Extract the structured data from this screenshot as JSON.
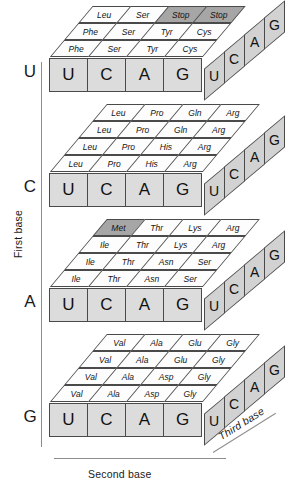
{
  "diagram": {
    "axes": {
      "first_base": "First base",
      "second_base": "Second base",
      "third_base": "Third base"
    },
    "second_base_letters": [
      "U",
      "C",
      "A",
      "G"
    ],
    "third_base_letters": [
      "U",
      "C",
      "A",
      "G"
    ],
    "colors": {
      "background": "#ffffff",
      "cell_fill": "#fdfdfd",
      "highlight_fill": "#a6a6a6",
      "front_face_fill": "#dcdcdc",
      "right_face_fill": "#d2d2d2",
      "stroke": "#4a4a4a",
      "text": "#141414"
    },
    "highlight_meaning": "special codons (Stop and Met start) are shaded gray",
    "blocks": [
      {
        "first_base": "U",
        "rows": [
          {
            "third_base": "G",
            "codons": [
              {
                "amino_acid": "Leu",
                "shaded": false
              },
              {
                "amino_acid": "Ser",
                "shaded": false
              },
              {
                "amino_acid": "Stop",
                "shaded": true
              },
              {
                "amino_acid": "Stop",
                "shaded": true
              }
            ]
          },
          {
            "third_base": "A",
            "codons": [
              {
                "amino_acid": "Phe",
                "shaded": false
              },
              {
                "amino_acid": "Ser",
                "shaded": false
              },
              {
                "amino_acid": "Tyr",
                "shaded": false
              },
              {
                "amino_acid": "Cys",
                "shaded": false
              }
            ]
          },
          {
            "third_base": "C",
            "codons": [
              {
                "amino_acid": "Phe",
                "shaded": false
              },
              {
                "amino_acid": "Ser",
                "shaded": false
              },
              {
                "amino_acid": "Tyr",
                "shaded": false
              },
              {
                "amino_acid": "Cys",
                "shaded": false
              }
            ]
          }
        ]
      },
      {
        "first_base": "C",
        "rows": [
          {
            "third_base": "G",
            "codons": [
              {
                "amino_acid": "Leu",
                "shaded": false
              },
              {
                "amino_acid": "Pro",
                "shaded": false
              },
              {
                "amino_acid": "Gln",
                "shaded": false
              },
              {
                "amino_acid": "Arg",
                "shaded": false
              }
            ]
          },
          {
            "third_base": "A",
            "codons": [
              {
                "amino_acid": "Leu",
                "shaded": false
              },
              {
                "amino_acid": "Pro",
                "shaded": false
              },
              {
                "amino_acid": "Gln",
                "shaded": false
              },
              {
                "amino_acid": "Arg",
                "shaded": false
              }
            ]
          },
          {
            "third_base": "C",
            "codons": [
              {
                "amino_acid": "Leu",
                "shaded": false
              },
              {
                "amino_acid": "Pro",
                "shaded": false
              },
              {
                "amino_acid": "His",
                "shaded": false
              },
              {
                "amino_acid": "Arg",
                "shaded": false
              }
            ]
          },
          {
            "third_base": "U",
            "codons": [
              {
                "amino_acid": "Leu",
                "shaded": false
              },
              {
                "amino_acid": "Pro",
                "shaded": false
              },
              {
                "amino_acid": "His",
                "shaded": false
              },
              {
                "amino_acid": "Arg",
                "shaded": false
              }
            ]
          }
        ]
      },
      {
        "first_base": "A",
        "rows": [
          {
            "third_base": "G",
            "codons": [
              {
                "amino_acid": "Met",
                "shaded": true
              },
              {
                "amino_acid": "Thr",
                "shaded": false
              },
              {
                "amino_acid": "Lys",
                "shaded": false
              },
              {
                "amino_acid": "Arg",
                "shaded": false
              }
            ]
          },
          {
            "third_base": "A",
            "codons": [
              {
                "amino_acid": "Ile",
                "shaded": false
              },
              {
                "amino_acid": "Thr",
                "shaded": false
              },
              {
                "amino_acid": "Lys",
                "shaded": false
              },
              {
                "amino_acid": "Arg",
                "shaded": false
              }
            ]
          },
          {
            "third_base": "C",
            "codons": [
              {
                "amino_acid": "Ile",
                "shaded": false
              },
              {
                "amino_acid": "Thr",
                "shaded": false
              },
              {
                "amino_acid": "Asn",
                "shaded": false
              },
              {
                "amino_acid": "Ser",
                "shaded": false
              }
            ]
          },
          {
            "third_base": "U",
            "codons": [
              {
                "amino_acid": "Ile",
                "shaded": false
              },
              {
                "amino_acid": "Thr",
                "shaded": false
              },
              {
                "amino_acid": "Asn",
                "shaded": false
              },
              {
                "amino_acid": "Ser",
                "shaded": false
              }
            ]
          }
        ]
      },
      {
        "first_base": "G",
        "rows": [
          {
            "third_base": "G",
            "codons": [
              {
                "amino_acid": "Val",
                "shaded": false
              },
              {
                "amino_acid": "Ala",
                "shaded": false
              },
              {
                "amino_acid": "Glu",
                "shaded": false
              },
              {
                "amino_acid": "Gly",
                "shaded": false
              }
            ]
          },
          {
            "third_base": "A",
            "codons": [
              {
                "amino_acid": "Val",
                "shaded": false
              },
              {
                "amino_acid": "Ala",
                "shaded": false
              },
              {
                "amino_acid": "Glu",
                "shaded": false
              },
              {
                "amino_acid": "Gly",
                "shaded": false
              }
            ]
          },
          {
            "third_base": "C",
            "codons": [
              {
                "amino_acid": "Val",
                "shaded": false
              },
              {
                "amino_acid": "Ala",
                "shaded": false
              },
              {
                "amino_acid": "Asp",
                "shaded": false
              },
              {
                "amino_acid": "Gly",
                "shaded": false
              }
            ]
          },
          {
            "third_base": "U",
            "codons": [
              {
                "amino_acid": "Val",
                "shaded": false
              },
              {
                "amino_acid": "Ala",
                "shaded": false
              },
              {
                "amino_acid": "Asp",
                "shaded": false
              },
              {
                "amino_acid": "Gly",
                "shaded": false
              }
            ]
          }
        ]
      }
    ]
  }
}
